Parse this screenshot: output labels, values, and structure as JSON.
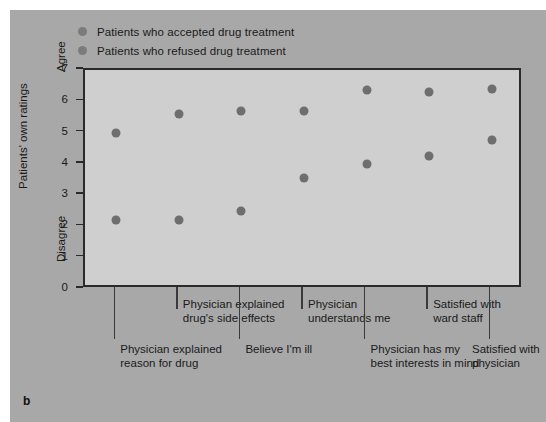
{
  "figure": {
    "letter": "b"
  },
  "legend": {
    "entries": [
      {
        "label": "Patients who accepted drug treatment",
        "color": "#7b7b7b"
      },
      {
        "label": "Patients who refused drug treatment",
        "color": "#7b7b7b"
      }
    ]
  },
  "chart_data": {
    "type": "scatter",
    "title": "",
    "xlabel": "",
    "ylabel": "Patients' own ratings",
    "ylim": [
      0,
      7
    ],
    "yticks": [
      0,
      1,
      2,
      3,
      4,
      5,
      6,
      7
    ],
    "ytick_labels": [
      "0",
      "1",
      "2",
      "3",
      "4",
      "5",
      "6",
      "7"
    ],
    "y_anchor_high": "Agree",
    "y_anchor_low": "Disagree",
    "grid": false,
    "legend_position": "top-left",
    "categories": [
      "Physician explained reason for drug",
      "Physician explained drug's side effects",
      "Believe I'm ill",
      "Physician understands me",
      "Physician has my best interests in mind",
      "Satisfied with ward staff",
      "Satisfied with physician"
    ],
    "category_lines": [
      [
        "Physician explained",
        "reason for drug"
      ],
      [
        "Physician explained",
        "drug's side effects"
      ],
      [
        "Believe I'm ill"
      ],
      [
        "Physician",
        "understands me"
      ],
      [
        "Physician has my",
        "best interests in mind"
      ],
      [
        "Satisfied with",
        "ward staff"
      ],
      [
        "Satisfied with",
        "physician"
      ]
    ],
    "series": [
      {
        "name": "Patients who accepted drug treatment",
        "values": [
          5.0,
          5.6,
          5.7,
          5.7,
          6.35,
          6.3,
          6.4
        ]
      },
      {
        "name": "Patients who refused drug treatment",
        "values": [
          2.2,
          2.2,
          2.5,
          3.55,
          4.0,
          4.25,
          4.75
        ]
      }
    ],
    "marker_color": "#6e6e6e",
    "plot_background": "#cfcfcf",
    "panel_background": "#a8a8a8"
  }
}
